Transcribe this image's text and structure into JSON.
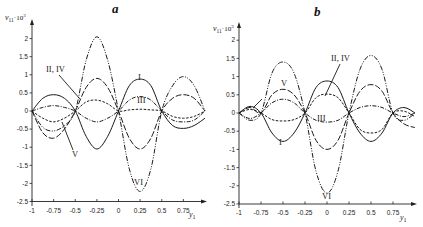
{
  "chart_data": [
    {
      "type": "line",
      "panel": "a",
      "title": "a",
      "xlabel": "y1",
      "ylabel": "v11·10^3",
      "xlim": [
        -1,
        1
      ],
      "ylim": [
        -2.5,
        2.2
      ],
      "grid": false,
      "legend_position": "inline labels",
      "x_ticks": [
        "-1",
        "-0.75",
        "-0.5",
        "-0.25",
        "0",
        "0.25",
        "0.5",
        "0.75"
      ],
      "y_ticks": [
        "2",
        "1.5",
        "1",
        "0.5",
        "0",
        "-0.5",
        "-1",
        "-1.5",
        "-2",
        "-2.5"
      ],
      "x": [
        -1,
        -0.875,
        -0.75,
        -0.625,
        -0.5,
        -0.375,
        -0.25,
        -0.125,
        0,
        0.125,
        0.25,
        0.375,
        0.5,
        0.625,
        0.75,
        0.875,
        1
      ],
      "series": [
        {
          "name": "I",
          "style": "solid",
          "values": [
            0,
            0.35,
            0.45,
            0.35,
            0,
            -0.7,
            -1.05,
            -0.7,
            0,
            0.7,
            0.88,
            0.7,
            0,
            -0.4,
            -0.48,
            -0.4,
            -0.2
          ]
        },
        {
          "name": "II, IV",
          "style": "dash-dot-dot",
          "values": [
            0,
            -0.45,
            -0.55,
            -0.4,
            0,
            1.4,
            2.05,
            1.4,
            0,
            -1.6,
            -2.22,
            -1.6,
            0,
            0.7,
            0.95,
            0.7,
            0
          ]
        },
        {
          "name": "III",
          "style": "dashed",
          "values": [
            0,
            -0.2,
            -0.3,
            -0.2,
            0,
            0.25,
            0.3,
            0.2,
            0,
            0.03,
            0.05,
            0.03,
            0,
            -0.15,
            -0.2,
            -0.15,
            0
          ]
        },
        {
          "name": "V",
          "style": "dash-long",
          "values": [
            0,
            -0.6,
            -0.75,
            -0.5,
            0,
            0.65,
            0.9,
            0.65,
            0,
            -0.75,
            -1.05,
            -0.75,
            0,
            0.35,
            0.45,
            0.35,
            0
          ]
        },
        {
          "name": "VI",
          "style": "dash-dot",
          "values": [
            0,
            0.1,
            0.15,
            0.1,
            0,
            -0.2,
            -0.3,
            -0.2,
            0,
            0.3,
            0.4,
            0.3,
            0,
            -0.25,
            -0.3,
            -0.25,
            0
          ]
        }
      ],
      "annotations": [
        "II, IV",
        "I",
        "III",
        "V",
        "VI"
      ]
    },
    {
      "type": "line",
      "panel": "b",
      "title": "b",
      "xlabel": "y1",
      "ylabel": "v11·10^3",
      "xlim": [
        -1,
        1
      ],
      "ylim": [
        -2.5,
        2.2
      ],
      "grid": false,
      "legend_position": "inline labels",
      "x_ticks": [
        "-1",
        "-0.75",
        "-0.5",
        "-0.25",
        "0",
        "0.25",
        "0.5",
        "0.75"
      ],
      "y_ticks": [
        "2",
        "1.5",
        "1",
        "0.5",
        "0",
        "-0.5",
        "-1",
        "-1.5",
        "-2",
        "-2.5"
      ],
      "x": [
        -1,
        -0.875,
        -0.75,
        -0.625,
        -0.5,
        -0.375,
        -0.25,
        -0.125,
        0,
        0.125,
        0.25,
        0.375,
        0.5,
        0.625,
        0.75,
        0.875,
        1
      ],
      "series": [
        {
          "name": "I",
          "style": "solid",
          "values": [
            0,
            0.18,
            0,
            -0.55,
            -0.78,
            -0.55,
            0,
            0.7,
            0.88,
            0.7,
            0,
            -0.55,
            -0.78,
            -0.55,
            0,
            0.15,
            0
          ]
        },
        {
          "name": "II, IV",
          "style": "dash-dot-dot",
          "values": [
            0,
            -0.2,
            0,
            1.1,
            1.4,
            1.1,
            0,
            -1.6,
            -2.2,
            -1.6,
            0,
            1.2,
            1.58,
            1.2,
            0,
            -0.2,
            0
          ]
        },
        {
          "name": "III",
          "style": "dashed",
          "values": [
            0,
            0.1,
            0,
            -0.18,
            -0.22,
            -0.18,
            0,
            0.42,
            0.52,
            0.42,
            0,
            -0.45,
            -0.55,
            -0.45,
            0,
            0.05,
            -0.1
          ]
        },
        {
          "name": "V",
          "style": "dash-long",
          "values": [
            0,
            0.15,
            0,
            0.5,
            0.65,
            0.5,
            0,
            -0.75,
            -1.0,
            -0.75,
            0,
            0.6,
            0.78,
            0.6,
            0,
            -0.3,
            -0.4
          ]
        },
        {
          "name": "VI",
          "style": "dash-dot",
          "values": [
            0,
            -0.15,
            0,
            0.28,
            0.38,
            0.28,
            0,
            -0.2,
            -0.25,
            -0.2,
            0,
            0.15,
            0.2,
            0.15,
            0,
            -0.1,
            0
          ]
        }
      ],
      "annotations": [
        "II, IV",
        "V",
        "III",
        "I",
        "VI"
      ]
    }
  ],
  "panels": {
    "a": {
      "title": "a",
      "ylabel_main": "v",
      "ylabel_sub": "11",
      "ylabel_mult": "·10",
      "ylabel_exp": "3",
      "xlabel_main": "y",
      "xlabel_sub": "1",
      "yticks": [
        "2",
        "1.5",
        "1",
        "0.5",
        "0",
        "-0.5",
        "-1",
        "-1.5",
        "-2",
        "-2.5"
      ],
      "xticks": [
        "-1",
        "-0.75",
        "-0.5",
        "-0.25",
        "0",
        "0.25",
        "0.5",
        "0.75"
      ],
      "labels": {
        "II_IV": "II, IV",
        "I": "I",
        "III": "III",
        "V": "V",
        "VI": "VI"
      }
    },
    "b": {
      "title": "b",
      "ylabel_main": "v",
      "ylabel_sub": "11",
      "ylabel_mult": "·10",
      "ylabel_exp": "3",
      "xlabel_main": "y",
      "xlabel_sub": "1",
      "yticks": [
        "2",
        "1.5",
        "1",
        "0.5",
        "0",
        "-0.5",
        "-1",
        "-1.5",
        "-2",
        "-2.5"
      ],
      "xticks": [
        "-1",
        "-0.75",
        "-0.5",
        "-0.25",
        "0",
        "0.25",
        "0.5",
        "0.75"
      ],
      "labels": {
        "II_IV": "II, IV",
        "V": "V",
        "III": "III",
        "I": "I",
        "VI": "VI"
      }
    }
  },
  "colors": {
    "ink": "#1a1a1a",
    "background": "#ffffff"
  }
}
